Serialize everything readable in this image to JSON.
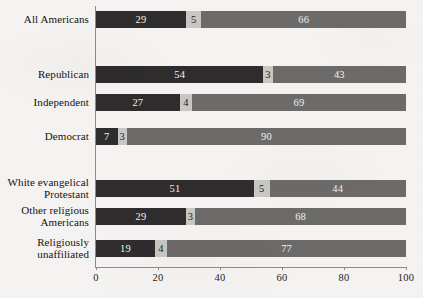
{
  "chart_data": {
    "type": "bar",
    "orientation": "horizontal",
    "stacked": true,
    "title": "",
    "subtitle": "",
    "xlabel": "",
    "ylabel": "",
    "xlim": [
      0,
      100
    ],
    "xticks": [
      0,
      20,
      40,
      60,
      80,
      100
    ],
    "xtick_labels": [
      "0",
      "20",
      "40",
      "60",
      "80",
      "100"
    ],
    "grid": false,
    "legend": false,
    "legend_position": "none",
    "categories": [
      "All Americans",
      "Republican",
      "Independent",
      "Democrat",
      "White evangelical\nProtestant",
      "Other religious\nAmericans",
      "Religiously\nunaffiliated"
    ],
    "series": [
      {
        "name": "segment-1",
        "color": "#2e2c2c",
        "values": [
          29,
          54,
          27,
          7,
          51,
          29,
          19
        ]
      },
      {
        "name": "segment-2",
        "color": "#c9c7c3",
        "values": [
          5,
          3,
          4,
          3,
          5,
          3,
          4
        ]
      },
      {
        "name": "segment-3",
        "color": "#6d6b6a",
        "values": [
          66,
          43,
          69,
          90,
          44,
          68,
          77
        ]
      }
    ],
    "rows": [
      {
        "label": "All Americans",
        "groupIndex": 0,
        "values": [
          29,
          5,
          66
        ]
      },
      {
        "label": "Republican",
        "groupIndex": 1,
        "values": [
          54,
          3,
          43
        ]
      },
      {
        "label": "Independent",
        "groupIndex": 1,
        "values": [
          27,
          4,
          69
        ]
      },
      {
        "label": "Democrat",
        "groupIndex": 1,
        "values": [
          7,
          3,
          90
        ]
      },
      {
        "label": "White evangelical\nProtestant",
        "groupIndex": 2,
        "values": [
          51,
          5,
          44
        ]
      },
      {
        "label": "Other religious\nAmericans",
        "groupIndex": 2,
        "values": [
          29,
          3,
          68
        ]
      },
      {
        "label": "Religiously\nunaffiliated",
        "groupIndex": 2,
        "values": [
          19,
          4,
          77
        ]
      }
    ]
  },
  "colors": {
    "background": "#f4f3f1",
    "axis": "#8d8b89",
    "text": "#14120f",
    "segment_dark": "#2e2c2c",
    "segment_light": "#c9c7c3",
    "segment_medium": "#6d6b6a"
  },
  "layout": {
    "plot_left_px": 96,
    "plot_right_px": 406,
    "bar_height_px": 17,
    "row_tops_px": [
      11,
      66,
      94,
      128,
      180,
      208,
      240
    ],
    "label_tops_px": [
      14,
      69,
      97,
      131,
      177,
      205,
      237
    ]
  }
}
